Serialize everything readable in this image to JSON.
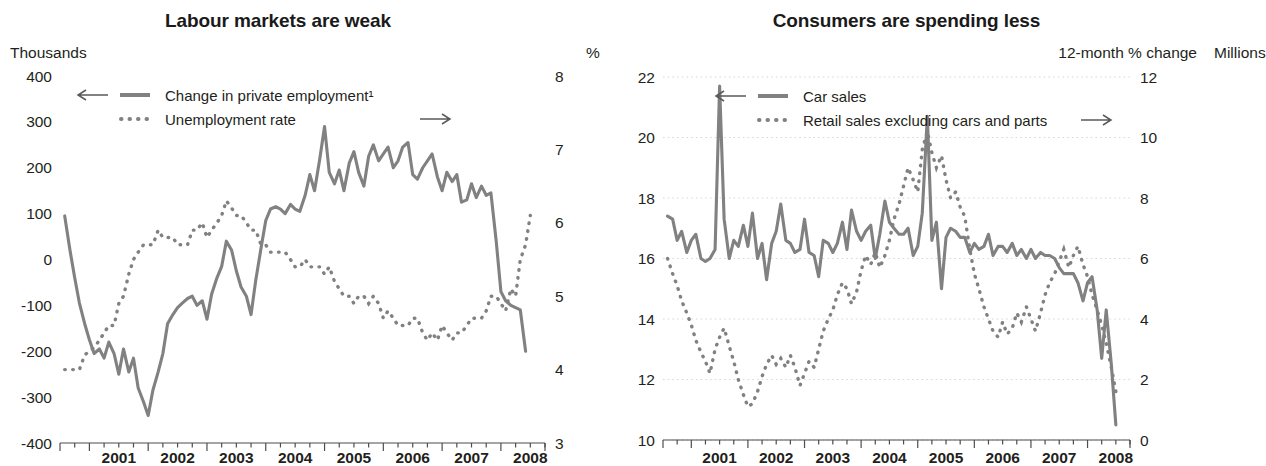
{
  "panels": [
    {
      "id": "labour",
      "title": "Labour markets are weak",
      "left_unit": "Thousands",
      "right_unit": "%"
    },
    {
      "id": "consumers",
      "title": "Consumers are spending less",
      "pct_unit": "%",
      "left_unit": "Millions",
      "right_unit": "12-month % change"
    }
  ],
  "chart_data": [
    {
      "type": "line",
      "title": "Labour markets are weak",
      "xlabel": "",
      "ylabel": "Thousands",
      "y2label": "%",
      "grid": false,
      "legend_position": "top-left",
      "xlim": [
        2000.5,
        2008.75
      ],
      "ylim": [
        -400,
        400
      ],
      "y2lim": [
        3,
        8
      ],
      "xticks": [
        "2001",
        "2002",
        "2003",
        "2004",
        "2005",
        "2006",
        "2007",
        "2008"
      ],
      "yticks": [
        400,
        300,
        200,
        100,
        0,
        -100,
        -200,
        -300,
        -400
      ],
      "y2ticks": [
        8,
        7,
        6,
        5,
        4,
        3
      ],
      "series": [
        {
          "name": "Change in private employment¹",
          "style": "solid",
          "axis": "left",
          "arrow": "left",
          "x": [
            2000.58,
            2000.67,
            2000.75,
            2000.83,
            2000.92,
            2001.0,
            2001.08,
            2001.17,
            2001.25,
            2001.33,
            2001.42,
            2001.5,
            2001.58,
            2001.67,
            2001.75,
            2001.83,
            2001.92,
            2002.0,
            2002.08,
            2002.17,
            2002.25,
            2002.33,
            2002.42,
            2002.5,
            2002.58,
            2002.67,
            2002.75,
            2002.83,
            2002.92,
            2003.0,
            2003.08,
            2003.17,
            2003.25,
            2003.33,
            2003.42,
            2003.5,
            2003.58,
            2003.67,
            2003.75,
            2003.83,
            2003.92,
            2004.0,
            2004.08,
            2004.17,
            2004.25,
            2004.33,
            2004.42,
            2004.5,
            2004.58,
            2004.67,
            2004.75,
            2004.83,
            2004.92,
            2005.0,
            2005.08,
            2005.17,
            2005.25,
            2005.33,
            2005.42,
            2005.5,
            2005.58,
            2005.67,
            2005.75,
            2005.83,
            2005.92,
            2006.0,
            2006.08,
            2006.17,
            2006.25,
            2006.33,
            2006.42,
            2006.5,
            2006.58,
            2006.67,
            2006.75,
            2006.83,
            2006.92,
            2007.0,
            2007.08,
            2007.17,
            2007.25,
            2007.33,
            2007.42,
            2007.5,
            2007.58,
            2007.67,
            2007.75,
            2007.83,
            2007.92,
            2008.0,
            2008.08,
            2008.17,
            2008.25,
            2008.33,
            2008.42,
            2008.5
          ],
          "y": [
            95,
            20,
            -40,
            -95,
            -140,
            -175,
            -205,
            -195,
            -215,
            -180,
            -205,
            -250,
            -195,
            -245,
            -215,
            -280,
            -310,
            -340,
            -285,
            -245,
            -205,
            -140,
            -120,
            -105,
            -95,
            -85,
            -80,
            -100,
            -90,
            -130,
            -75,
            -40,
            -15,
            40,
            20,
            -25,
            -60,
            -80,
            -120,
            -45,
            25,
            85,
            110,
            115,
            110,
            100,
            120,
            110,
            105,
            140,
            185,
            150,
            220,
            290,
            190,
            165,
            195,
            150,
            210,
            235,
            190,
            160,
            225,
            250,
            215,
            230,
            245,
            200,
            215,
            245,
            255,
            185,
            175,
            200,
            215,
            230,
            180,
            150,
            190,
            170,
            185,
            125,
            130,
            165,
            135,
            160,
            140,
            145,
            40,
            -70,
            -90,
            -100,
            -105,
            -110,
            -200
          ]
        },
        {
          "name": "Unemployment rate",
          "style": "dotted",
          "axis": "right",
          "arrow": "right",
          "x": [
            2000.58,
            2000.67,
            2000.75,
            2000.83,
            2000.92,
            2001.0,
            2001.08,
            2001.17,
            2001.25,
            2001.33,
            2001.42,
            2001.5,
            2001.58,
            2001.67,
            2001.75,
            2001.83,
            2001.92,
            2002.0,
            2002.08,
            2002.17,
            2002.25,
            2002.33,
            2002.42,
            2002.5,
            2002.58,
            2002.67,
            2002.75,
            2002.83,
            2002.92,
            2003.0,
            2003.08,
            2003.17,
            2003.25,
            2003.33,
            2003.42,
            2003.5,
            2003.58,
            2003.67,
            2003.75,
            2003.83,
            2003.92,
            2004.0,
            2004.08,
            2004.17,
            2004.25,
            2004.33,
            2004.42,
            2004.5,
            2004.58,
            2004.67,
            2004.75,
            2004.83,
            2004.92,
            2005.0,
            2005.08,
            2005.17,
            2005.25,
            2005.33,
            2005.42,
            2005.5,
            2005.58,
            2005.67,
            2005.75,
            2005.83,
            2005.92,
            2006.0,
            2006.08,
            2006.17,
            2006.25,
            2006.33,
            2006.42,
            2006.5,
            2006.58,
            2006.67,
            2006.75,
            2006.83,
            2006.92,
            2007.0,
            2007.08,
            2007.17,
            2007.25,
            2007.33,
            2007.42,
            2007.5,
            2007.58,
            2007.67,
            2007.75,
            2007.83,
            2007.92,
            2008.0,
            2008.08,
            2008.17,
            2008.25,
            2008.33,
            2008.42,
            2008.5
          ],
          "y": [
            4.0,
            4.0,
            4.0,
            4.0,
            4.2,
            4.25,
            4.3,
            4.4,
            4.5,
            4.6,
            4.6,
            4.9,
            5.0,
            5.3,
            5.5,
            5.6,
            5.7,
            5.7,
            5.7,
            5.9,
            5.8,
            5.8,
            5.8,
            5.7,
            5.7,
            5.7,
            5.9,
            5.9,
            6.0,
            5.8,
            5.9,
            6.0,
            6.1,
            6.3,
            6.2,
            6.1,
            6.1,
            6.0,
            5.9,
            5.9,
            5.7,
            5.7,
            5.6,
            5.6,
            5.6,
            5.6,
            5.5,
            5.4,
            5.4,
            5.5,
            5.4,
            5.4,
            5.4,
            5.3,
            5.4,
            5.2,
            5.1,
            5.0,
            5.0,
            4.9,
            5.0,
            5.0,
            4.9,
            5.0,
            4.9,
            4.7,
            4.8,
            4.7,
            4.6,
            4.6,
            4.6,
            4.7,
            4.7,
            4.5,
            4.4,
            4.5,
            4.4,
            4.6,
            4.5,
            4.4,
            4.5,
            4.5,
            4.6,
            4.7,
            4.7,
            4.7,
            4.8,
            5.0,
            5.0,
            4.9,
            4.8,
            5.1,
            5.0,
            5.5,
            5.7,
            6.1
          ]
        }
      ]
    },
    {
      "type": "line",
      "title": "Consumers are spending less",
      "xlabel": "",
      "ylabel": "Millions",
      "y2label": "12-month % change",
      "grid": true,
      "legend_position": "top-center",
      "xlim": [
        2000.5,
        2008.75
      ],
      "ylim": [
        10,
        22
      ],
      "y2lim": [
        0,
        12
      ],
      "xticks": [
        "2001",
        "2002",
        "2003",
        "2004",
        "2005",
        "2006",
        "2007",
        "2008"
      ],
      "yticks": [
        22,
        20,
        18,
        16,
        14,
        12,
        10
      ],
      "y2ticks": [
        12,
        10,
        8,
        6,
        4,
        2,
        0
      ],
      "series": [
        {
          "name": "Car sales",
          "style": "solid",
          "axis": "left",
          "arrow": "left",
          "x": [
            2000.58,
            2000.67,
            2000.75,
            2000.83,
            2000.92,
            2001.0,
            2001.08,
            2001.17,
            2001.25,
            2001.33,
            2001.42,
            2001.5,
            2001.58,
            2001.67,
            2001.75,
            2001.83,
            2001.92,
            2002.0,
            2002.08,
            2002.17,
            2002.25,
            2002.33,
            2002.42,
            2002.5,
            2002.58,
            2002.67,
            2002.75,
            2002.83,
            2002.92,
            2003.0,
            2003.08,
            2003.17,
            2003.25,
            2003.33,
            2003.42,
            2003.5,
            2003.58,
            2003.67,
            2003.75,
            2003.83,
            2003.92,
            2004.0,
            2004.08,
            2004.17,
            2004.25,
            2004.33,
            2004.42,
            2004.5,
            2004.58,
            2004.67,
            2004.75,
            2004.83,
            2004.92,
            2005.0,
            2005.08,
            2005.17,
            2005.25,
            2005.33,
            2005.42,
            2005.5,
            2005.58,
            2005.67,
            2005.75,
            2005.83,
            2005.92,
            2006.0,
            2006.08,
            2006.17,
            2006.25,
            2006.33,
            2006.42,
            2006.5,
            2006.58,
            2006.67,
            2006.75,
            2006.83,
            2006.92,
            2007.0,
            2007.08,
            2007.17,
            2007.25,
            2007.33,
            2007.42,
            2007.5,
            2007.58,
            2007.67,
            2007.75,
            2007.83,
            2007.92,
            2008.0,
            2008.08,
            2008.17,
            2008.25,
            2008.33,
            2008.42,
            2008.5
          ],
          "y": [
            17.4,
            17.3,
            16.6,
            16.9,
            16.2,
            16.6,
            16.8,
            16.0,
            15.9,
            16.0,
            16.3,
            21.7,
            17.3,
            16.0,
            16.6,
            16.4,
            17.1,
            16.4,
            17.5,
            16.0,
            16.5,
            15.3,
            16.5,
            16.9,
            17.8,
            16.6,
            16.5,
            16.2,
            16.3,
            17.3,
            16.2,
            16.1,
            15.4,
            16.6,
            16.5,
            16.2,
            16.5,
            17.2,
            16.3,
            17.6,
            16.9,
            16.6,
            16.9,
            17.1,
            16.0,
            16.8,
            17.9,
            17.2,
            17.0,
            16.8,
            16.8,
            17.0,
            16.1,
            16.4,
            17.5,
            20.7,
            16.6,
            17.2,
            15.0,
            16.7,
            17.0,
            16.9,
            16.7,
            16.7,
            16.2,
            16.5,
            16.3,
            16.4,
            16.8,
            16.1,
            16.4,
            16.4,
            16.2,
            16.5,
            16.1,
            16.3,
            16.0,
            16.3,
            16.0,
            16.2,
            16.1,
            16.1,
            16.0,
            15.7,
            15.5,
            15.5,
            15.5,
            15.2,
            14.6,
            15.2,
            15.4,
            14.3,
            12.7,
            14.3,
            12.5,
            10.5
          ]
        },
        {
          "name": "Retail sales excluding cars and parts",
          "style": "dotted",
          "axis": "right",
          "arrow": "right",
          "x": [
            2000.58,
            2000.67,
            2000.75,
            2000.83,
            2000.92,
            2001.0,
            2001.08,
            2001.17,
            2001.25,
            2001.33,
            2001.42,
            2001.5,
            2001.58,
            2001.67,
            2001.75,
            2001.83,
            2001.92,
            2002.0,
            2002.08,
            2002.17,
            2002.25,
            2002.33,
            2002.42,
            2002.5,
            2002.58,
            2002.67,
            2002.75,
            2002.83,
            2002.92,
            2003.0,
            2003.08,
            2003.17,
            2003.25,
            2003.33,
            2003.42,
            2003.5,
            2003.58,
            2003.67,
            2003.75,
            2003.83,
            2003.92,
            2004.0,
            2004.08,
            2004.17,
            2004.25,
            2004.33,
            2004.42,
            2004.5,
            2004.58,
            2004.67,
            2004.75,
            2004.83,
            2004.92,
            2005.0,
            2005.08,
            2005.17,
            2005.25,
            2005.33,
            2005.42,
            2005.5,
            2005.58,
            2005.67,
            2005.75,
            2005.83,
            2005.92,
            2006.0,
            2006.08,
            2006.17,
            2006.25,
            2006.33,
            2006.42,
            2006.5,
            2006.58,
            2006.67,
            2006.75,
            2006.83,
            2006.92,
            2007.0,
            2007.08,
            2007.17,
            2007.25,
            2007.33,
            2007.42,
            2007.5,
            2007.58,
            2007.67,
            2007.75,
            2007.83,
            2007.92,
            2008.0,
            2008.08,
            2008.17,
            2008.25,
            2008.33,
            2008.42,
            2008.5
          ],
          "y": [
            6.0,
            5.5,
            5.1,
            4.6,
            4.2,
            3.8,
            3.3,
            2.9,
            2.6,
            2.2,
            3.0,
            3.4,
            3.7,
            3.1,
            2.6,
            2.0,
            1.5,
            1.1,
            1.2,
            1.6,
            2.1,
            2.5,
            2.8,
            2.5,
            2.7,
            2.4,
            2.8,
            2.4,
            1.8,
            2.2,
            2.6,
            2.4,
            3.0,
            3.6,
            4.0,
            4.3,
            4.8,
            5.2,
            5.0,
            4.5,
            4.9,
            5.6,
            6.1,
            5.8,
            6.2,
            5.7,
            6.1,
            6.6,
            7.3,
            7.8,
            8.4,
            9.0,
            8.6,
            8.2,
            9.6,
            10.2,
            9.5,
            9.0,
            9.4,
            8.6,
            8.0,
            8.2,
            7.7,
            7.4,
            6.3,
            5.5,
            5.0,
            4.4,
            4.0,
            3.6,
            3.4,
            3.9,
            3.5,
            3.7,
            4.2,
            3.9,
            4.4,
            4.0,
            3.6,
            4.2,
            4.8,
            5.2,
            5.5,
            5.9,
            6.3,
            5.7,
            6.1,
            6.4,
            5.8,
            5.4,
            4.8,
            4.3,
            3.8,
            3.2,
            2.4,
            1.6
          ]
        }
      ]
    }
  ],
  "legends": [
    {
      "arrow_left": "←",
      "arrow_right": "→",
      "entries": [
        {
          "label": "Change in private employment¹",
          "style": "solid"
        },
        {
          "label": "Unemployment rate",
          "style": "dotted"
        }
      ]
    },
    {
      "arrow_left": "←",
      "arrow_right": "→",
      "entries": [
        {
          "label": "Car sales",
          "style": "solid"
        },
        {
          "label": "Retail sales excluding cars and parts",
          "style": "dotted"
        }
      ]
    }
  ],
  "colors": {
    "series": "#818181",
    "text": "#231f20",
    "grid": "#d8d8d8",
    "axis": "#4d4d4d"
  }
}
